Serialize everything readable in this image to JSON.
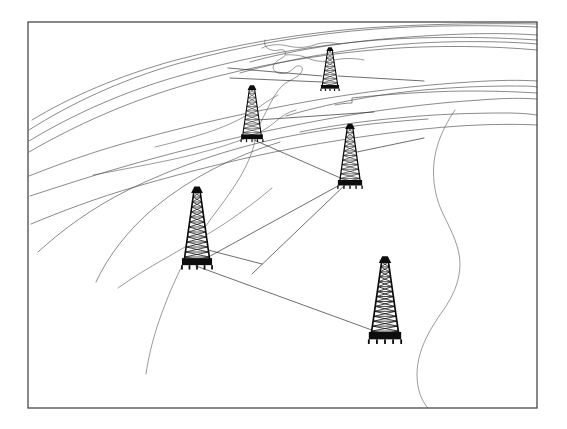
{
  "illustration": {
    "title": "Oil field survey line drawing",
    "subject": "oil-derricks-over-terrain-contours",
    "style": "black-and-white line art",
    "background_color": "#ffffff",
    "ink_color": "#0d0d0d",
    "contour_color": "#4a4a4a",
    "survey_line_color": "#2f2f2f"
  },
  "frame": {
    "name": "image-border",
    "x": 28,
    "y": 22,
    "width": 509,
    "height": 386,
    "stroke_color": "#3a3a3a",
    "stroke_width": 1.2
  },
  "derricks": [
    {
      "id": "derrick-north",
      "label": "north derrick",
      "base_x": 330,
      "base_y": 87,
      "height": 37,
      "base_half_width": 8,
      "top_half_width": 2.2,
      "rungs": 9
    },
    {
      "id": "derrick-northwest",
      "label": "northwest derrick",
      "base_x": 252,
      "base_y": 137,
      "height": 48,
      "base_half_width": 9.5,
      "top_half_width": 2.6,
      "rungs": 11
    },
    {
      "id": "derrick-center-east",
      "label": "center east derrick",
      "base_x": 350,
      "base_y": 183,
      "height": 55,
      "base_half_width": 10.5,
      "top_half_width": 2.8,
      "rungs": 12
    },
    {
      "id": "derrick-west",
      "label": "west derrick",
      "base_x": 197,
      "base_y": 262,
      "height": 70,
      "base_half_width": 13,
      "top_half_width": 3.2,
      "rungs": 14
    },
    {
      "id": "derrick-southeast",
      "label": "southeast derrick",
      "base_x": 385,
      "base_y": 336,
      "height": 74,
      "base_half_width": 14,
      "top_half_width": 3.4,
      "rungs": 15
    }
  ],
  "survey_lines": [
    {
      "id": "line-northwest-to-center-east",
      "from": "derrick-northwest",
      "to": "derrick-center-east",
      "x1": 254,
      "y1": 140,
      "x2": 345,
      "y2": 180
    },
    {
      "id": "line-west-to-center-east",
      "from": "derrick-west",
      "to": "derrick-center-east",
      "x1": 203,
      "y1": 260,
      "x2": 347,
      "y2": 181
    },
    {
      "id": "line-west-to-southeast",
      "from": "derrick-west",
      "to": "derrick-southeast",
      "x1": 196,
      "y1": 266,
      "x2": 380,
      "y2": 333
    },
    {
      "id": "line-center-east-to-southwest-spur",
      "from": "derrick-center-east",
      "to": "southwest-spur",
      "x1": 346,
      "y1": 184,
      "x2": 252,
      "y2": 274
    },
    {
      "id": "line-north-bearing-west",
      "from": "derrick-north",
      "to": "west-margin",
      "x1": 322,
      "y1": 76,
      "x2": 228,
      "y2": 68
    },
    {
      "id": "line-north-bearing-east",
      "from": "derrick-north",
      "to": "east-margin",
      "x1": 338,
      "y1": 76,
      "x2": 420,
      "y2": 80
    },
    {
      "id": "line-northwest-bearing-east",
      "from": "derrick-northwest",
      "to": "east-margin",
      "x1": 257,
      "y1": 120,
      "x2": 372,
      "y2": 113
    },
    {
      "id": "line-center-east-bearing-east",
      "from": "derrick-center-east",
      "to": "east-margin",
      "x1": 356,
      "y1": 155,
      "x2": 420,
      "y2": 140
    }
  ],
  "terrain": {
    "contour_count": 14,
    "river_count": 4,
    "description": "curving terrain contour bands sweeping from upper-left to right with meandering river channels"
  }
}
